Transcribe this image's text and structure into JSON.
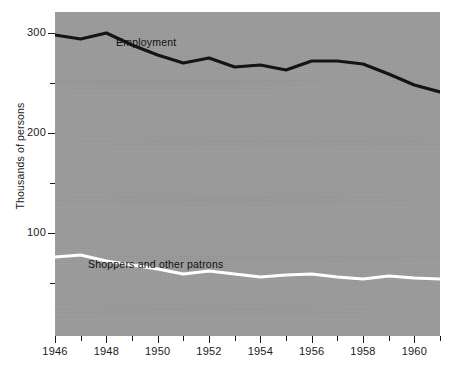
{
  "chart_data": {
    "type": "line",
    "title": "",
    "xlabel": "",
    "ylabel": "Thousands of persons",
    "xlim": [
      1946,
      1961
    ],
    "ylim": [
      0,
      310
    ],
    "yticks": [
      100,
      200,
      300
    ],
    "ytick_labels": [
      "100",
      "200",
      "300"
    ],
    "yminor_ticks": [
      50,
      150,
      250
    ],
    "xticks": [
      1946,
      1948,
      1950,
      1952,
      1954,
      1956,
      1958,
      1960
    ],
    "xtick_labels": [
      "1946",
      "1948",
      "1950",
      "1952",
      "1954",
      "1956",
      "1958",
      "1960"
    ],
    "xminor_ticks": [
      1947,
      1949,
      1951,
      1953,
      1955,
      1957,
      1959,
      1961
    ],
    "grid": false,
    "legend_position": "inline-annotation",
    "plot_background": "#9b9b9b",
    "x": [
      1946,
      1947,
      1948,
      1949,
      1950,
      1951,
      1952,
      1953,
      1954,
      1955,
      1956,
      1957,
      1958,
      1959,
      1960,
      1961
    ],
    "series": [
      {
        "name": "Employment",
        "color": "#141414",
        "line_width": 3.2,
        "annotation": "Employment",
        "values": [
          298,
          294,
          300,
          288,
          278,
          270,
          275,
          266,
          268,
          263,
          272,
          272,
          269,
          259,
          248,
          241
        ]
      },
      {
        "name": "Shoppers and other patrons",
        "color": "#ffffff",
        "line_width": 3.2,
        "annotation": "Shoppers and other patrons",
        "values": [
          76,
          78,
          72,
          68,
          64,
          59,
          62,
          59,
          56,
          58,
          59,
          56,
          54,
          57,
          55,
          54
        ]
      }
    ]
  },
  "axis": {
    "y_title": "Thousands of persons"
  }
}
